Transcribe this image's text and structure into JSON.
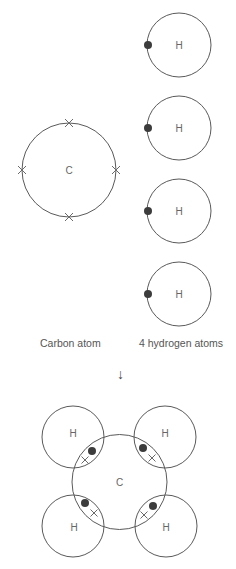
{
  "colors": {
    "line": "#5a5a5a",
    "electron": "#3c3c3c",
    "text": "#555555",
    "background": "#ffffff"
  },
  "reactants": {
    "carbon": {
      "symbol": "C",
      "label": "Carbon atom",
      "outer_electrons": 4,
      "electron_marker": "cross"
    },
    "hydrogens": {
      "symbol": "H",
      "count": 4,
      "label": "4 hydrogen atoms",
      "electron_marker": "dot",
      "atoms": [
        {
          "symbol": "H"
        },
        {
          "symbol": "H"
        },
        {
          "symbol": "H"
        },
        {
          "symbol": "H"
        }
      ]
    }
  },
  "arrow": "↓",
  "product": {
    "center_symbol": "C",
    "bonded_atoms": [
      {
        "symbol": "H",
        "position": "top-left"
      },
      {
        "symbol": "H",
        "position": "top-right"
      },
      {
        "symbol": "H",
        "position": "bottom-left"
      },
      {
        "symbol": "H",
        "position": "bottom-right"
      }
    ],
    "shared_pairs": 4
  }
}
